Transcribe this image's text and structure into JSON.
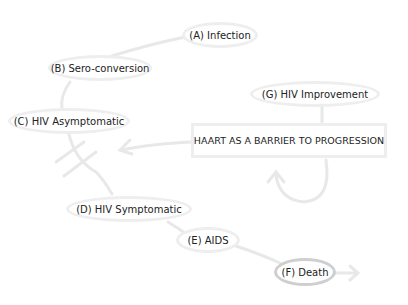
{
  "diagram": {
    "nodes": {
      "A": "(A) Infection",
      "B": "(B) Sero-conversion",
      "C": "(C) HIV Asymptomatic",
      "D": "(D) HIV Symptomatic",
      "E": "(E) AIDS",
      "F": "(F) Death",
      "G": "(G) HIV Improvement",
      "haart": "HAART AS A BARRIER TO PROGRESSION"
    },
    "colors": {
      "link": "#e8e8e8",
      "node_border": "#eeeeee",
      "death_border": "#cfcfcf",
      "text": "#222222"
    }
  }
}
